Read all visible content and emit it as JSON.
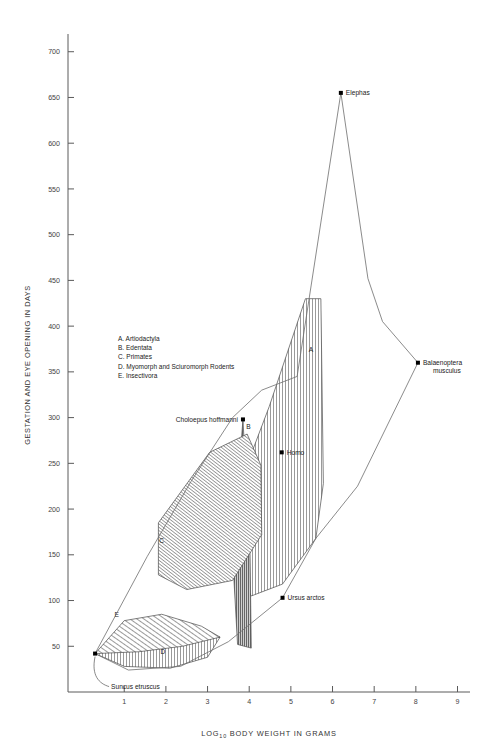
{
  "chart_data": {
    "type": "scatter",
    "title": "",
    "xlabel": "LOG10 BODY WEIGHT IN GRAMS",
    "xlabel_base": "LOG",
    "xlabel_sub": "10",
    "xlabel_rest": "BODY WEIGHT IN GRAMS",
    "ylabel": "GESTATION AND EYE OPENING IN DAYS",
    "xlim": [
      -0.35,
      9.3
    ],
    "ylim": [
      0,
      715
    ],
    "xticks": [
      1,
      2,
      3,
      4,
      5,
      6,
      7,
      8,
      9
    ],
    "xtick_labels": [
      "1",
      "2",
      "3",
      "4",
      "5",
      "6",
      "7",
      "8",
      "9"
    ],
    "yticks": [
      50,
      100,
      150,
      200,
      250,
      300,
      350,
      400,
      450,
      500,
      550,
      600,
      650,
      700
    ],
    "ytick_labels": [
      "50",
      "100",
      "150",
      "200",
      "250",
      "300",
      "350",
      "400",
      "450",
      "500",
      "550",
      "600",
      "650",
      "700"
    ],
    "grid": false,
    "legend_position": "upper-left-inside",
    "legend": [
      {
        "key": "A",
        "label": "A.  Artiodactyla"
      },
      {
        "key": "B",
        "label": "B.  Edentata"
      },
      {
        "key": "C",
        "label": "C.  Primates"
      },
      {
        "key": "D",
        "label": "D.  Myomorph and Sciuromorph Rodents"
      },
      {
        "key": "E",
        "label": "E.  Insectivora"
      }
    ],
    "annotations": [
      {
        "name": "Elephas",
        "x": 6.2,
        "y": 655
      },
      {
        "name": "Balaenoptera musculus",
        "line1": "Balaenoptera",
        "line2": "musculus",
        "x": 8.05,
        "y": 360
      },
      {
        "name": "Choloepus hoffmanni",
        "x": 3.85,
        "y": 298
      },
      {
        "name": "Homo",
        "x": 4.78,
        "y": 262
      },
      {
        "name": "Ursus arctos",
        "x": 4.8,
        "y": 103
      },
      {
        "name": "Suncus etruscus",
        "x": 0.3,
        "y": 42
      }
    ],
    "outer_envelope": [
      [
        0.3,
        42
      ],
      [
        1.55,
        148
      ],
      [
        2.6,
        230
      ],
      [
        3.6,
        300
      ],
      [
        4.3,
        330
      ],
      [
        5.15,
        345
      ],
      [
        6.2,
        655
      ],
      [
        6.85,
        452
      ],
      [
        7.2,
        405
      ],
      [
        8.05,
        360
      ],
      [
        6.6,
        225
      ],
      [
        5.6,
        168
      ],
      [
        4.8,
        103
      ],
      [
        3.5,
        55
      ],
      [
        2.35,
        28
      ],
      [
        1.1,
        24
      ],
      [
        0.3,
        42
      ]
    ],
    "regions": [
      {
        "key": "A",
        "name": "Artiodactyla",
        "hatch": "vertical",
        "label_xy": [
          5.48,
          372
        ],
        "points": [
          [
            3.42,
            158
          ],
          [
            3.78,
            228
          ],
          [
            4.48,
            312
          ],
          [
            5.35,
            430
          ],
          [
            5.72,
            430
          ],
          [
            5.78,
            228
          ],
          [
            5.6,
            168
          ],
          [
            4.8,
            118
          ],
          [
            4.05,
            105
          ],
          [
            3.42,
            158
          ]
        ]
      },
      {
        "key": "B",
        "name": "Edentata",
        "hatch": "dark-vertical",
        "label_xy": [
          3.98,
          288
        ],
        "points": [
          [
            3.85,
            298
          ],
          [
            4.02,
            150
          ],
          [
            4.05,
            48
          ],
          [
            3.72,
            52
          ],
          [
            3.6,
            150
          ],
          [
            3.85,
            298
          ]
        ]
      },
      {
        "key": "C",
        "name": "Primates",
        "hatch": "diagonal-dense",
        "label_xy": [
          1.9,
          163
        ],
        "points": [
          [
            1.82,
            185
          ],
          [
            3.05,
            262
          ],
          [
            3.95,
            282
          ],
          [
            4.28,
            248
          ],
          [
            4.3,
            172
          ],
          [
            3.6,
            122
          ],
          [
            2.5,
            112
          ],
          [
            1.82,
            128
          ],
          [
            1.82,
            185
          ]
        ]
      },
      {
        "key": "D",
        "name": "Myomorph and Sciuromorph Rodents",
        "hatch": "vertical",
        "label_xy": [
          1.93,
          42
        ],
        "points": [
          [
            0.3,
            42
          ],
          [
            1.0,
            28
          ],
          [
            2.1,
            26
          ],
          [
            3.0,
            38
          ],
          [
            3.3,
            60
          ],
          [
            2.6,
            66
          ],
          [
            1.6,
            58
          ],
          [
            0.3,
            42
          ]
        ]
      },
      {
        "key": "E",
        "name": "Insectivora",
        "hatch": "diagonal",
        "label_xy": [
          0.82,
          82
        ],
        "points": [
          [
            0.3,
            42
          ],
          [
            1.0,
            78
          ],
          [
            1.9,
            85
          ],
          [
            2.85,
            72
          ],
          [
            3.3,
            60
          ],
          [
            2.4,
            50
          ],
          [
            1.35,
            44
          ],
          [
            0.3,
            42
          ]
        ]
      }
    ],
    "point_markers": [
      {
        "name": "Elephas",
        "x": 6.2,
        "y": 655
      },
      {
        "name": "Balaenoptera musculus",
        "x": 8.05,
        "y": 360
      },
      {
        "name": "Choloepus hoffmanni",
        "x": 3.85,
        "y": 298
      },
      {
        "name": "Homo",
        "x": 4.78,
        "y": 262
      },
      {
        "name": "Ursus arctos",
        "x": 4.8,
        "y": 103
      },
      {
        "name": "Suncus etruscus",
        "x": 0.3,
        "y": 42
      }
    ]
  }
}
